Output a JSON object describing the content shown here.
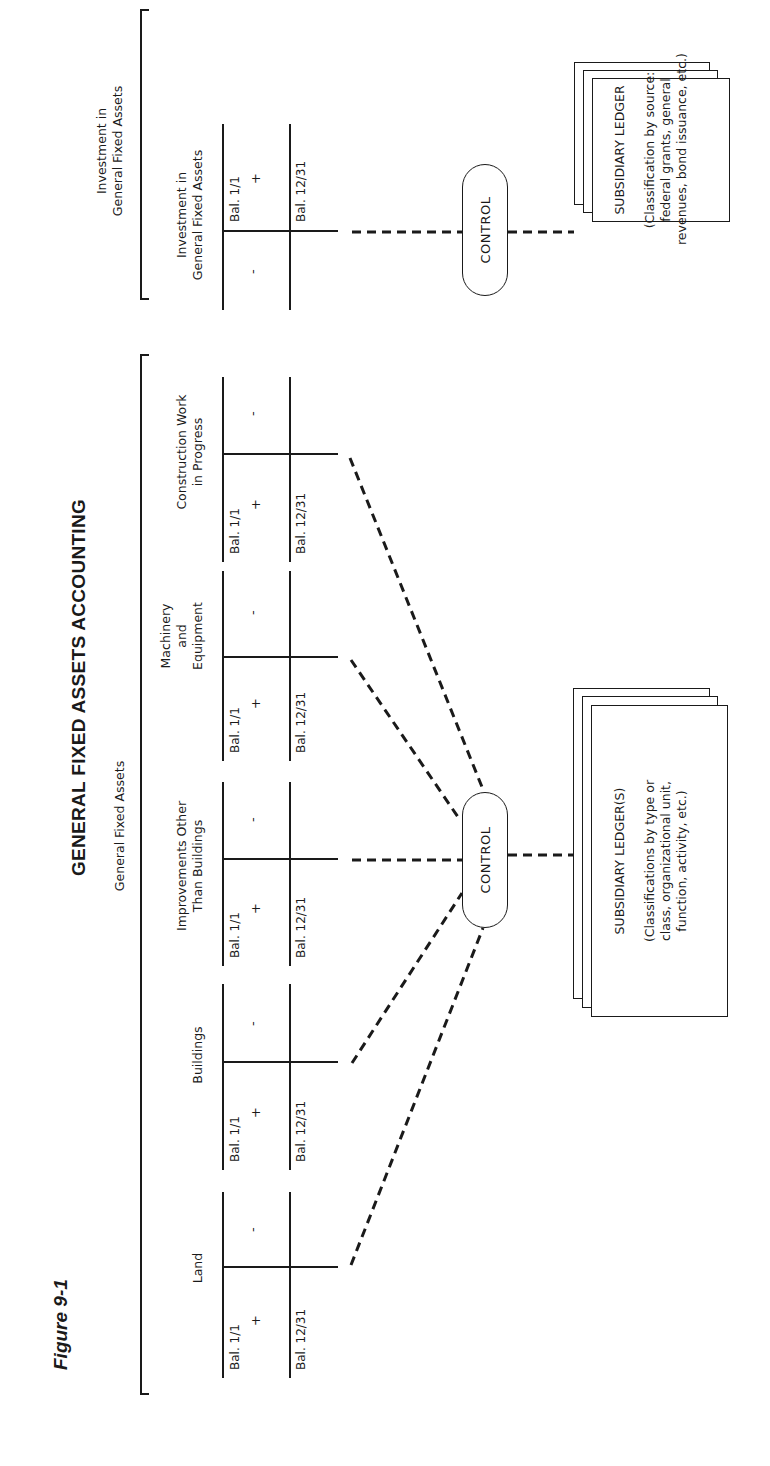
{
  "figure": {
    "label": "Figure 9-1",
    "title": "GENERAL FIXED ASSETS ACCOUNTING"
  },
  "general_fixed_assets": {
    "section_label": "General Fixed Assets",
    "accounts": [
      {
        "title_lines": [
          "Land"
        ],
        "debit_top": "Bal. 1/1",
        "debit_sign": "+",
        "credit_sign": "-",
        "ending": "Bal. 12/31"
      },
      {
        "title_lines": [
          "Buildings"
        ],
        "debit_top": "Bal. 1/1",
        "debit_sign": "+",
        "credit_sign": "-",
        "ending": "Bal. 12/31"
      },
      {
        "title_lines": [
          "Improvements Other",
          "Than Buildings"
        ],
        "debit_top": "Bal. 1/1",
        "debit_sign": "+",
        "credit_sign": "-",
        "ending": "Bal. 12/31"
      },
      {
        "title_lines": [
          "Machinery",
          "and",
          "Equipment"
        ],
        "debit_top": "Bal. 1/1",
        "debit_sign": "+",
        "credit_sign": "-",
        "ending": "Bal. 12/31"
      },
      {
        "title_lines": [
          "Construction Work",
          "in Progress"
        ],
        "debit_top": "Bal. 1/1",
        "debit_sign": "+",
        "credit_sign": "-",
        "ending": "Bal. 12/31"
      }
    ],
    "control_label": "CONTROL",
    "ledger": {
      "title": "SUBSIDIARY LEDGER(S)",
      "description_lines": [
        "(Classifications by type or",
        "class, organizational unit,",
        "function, activity, etc.)"
      ]
    }
  },
  "investment": {
    "section_label_lines": [
      "Investment in",
      "General Fixed Assets"
    ],
    "account": {
      "title_lines": [
        "Investment in",
        "General Fixed Assets"
      ],
      "debit_sign": "-",
      "credit_top": "Bal. 1/1",
      "credit_sign": "+",
      "ending": "Bal. 12/31"
    },
    "control_label": "CONTROL",
    "ledger": {
      "title": "SUBSIDIARY LEDGER",
      "description_lines": [
        "(Classification by source:",
        "federal grants, general",
        "revenues, bond issuance, etc.)"
      ]
    }
  },
  "colors": {
    "ink": "#1a1a1a",
    "paper": "#ffffff"
  }
}
